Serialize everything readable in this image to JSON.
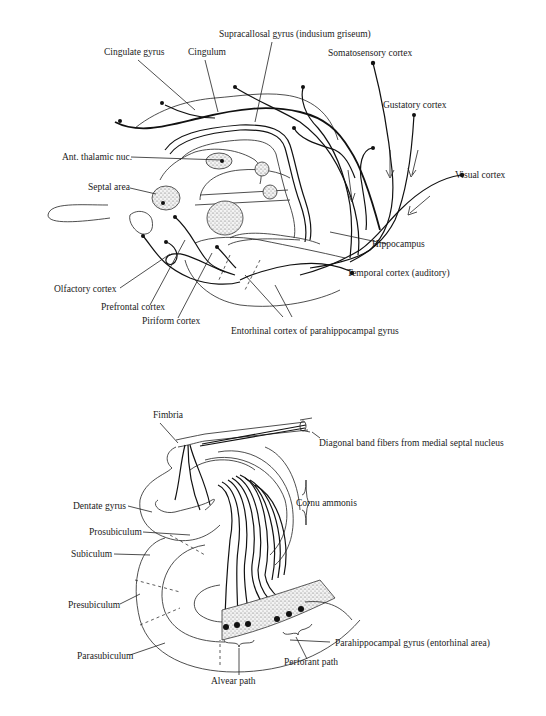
{
  "figure": {
    "top_panel": {
      "title": "Hippocampal afferent connections (medial view)",
      "labels": {
        "supracallosal_gyrus": "Supracallosal gyrus (indusium griseum)",
        "cingulate_gyrus": "Cingulate gyrus",
        "cingulum": "Cingulum",
        "somatosensory_cortex": "Somatosensory cortex",
        "gustatory_cortex": "Gustatory cortex",
        "ant_thalamic_nuc": "Ant. thalamic nuc.",
        "septal_area": "Septal area",
        "visual_cortex": "Visual cortex",
        "hippocampus": "Hippocampus",
        "temporal_cortex": "Temporal cortex (auditory)",
        "olfactory_cortex": "Olfactory cortex",
        "prefrontal_cortex": "Prefrontal cortex",
        "piriform_cortex": "Piriform cortex",
        "entorhinal_cortex": "Entorhinal cortex of parahippocampal gyrus"
      }
    },
    "bottom_panel": {
      "title": "Hippocampal formation cross-section",
      "labels": {
        "fimbria": "Fimbria",
        "diagonal_band": "Diagonal band fibers from medial septal nucleus",
        "cornu_ammonis": "Cornu ammonis",
        "dentate_gyrus": "Dentate gyrus",
        "prosubiculum": "Prosubiculum",
        "subiculum": "Subiculum",
        "presubiculum": "Presubiculum",
        "parasubiculum": "Parasubiculum",
        "parahippocampal_gyrus": "Parahippocampal gyrus (entorhinal area)",
        "perforant_path": "Perforant path",
        "alvear_path": "Alvear path"
      }
    },
    "colors": {
      "ink": "#111111",
      "background": "#ffffff",
      "stipple": "#888888"
    }
  }
}
